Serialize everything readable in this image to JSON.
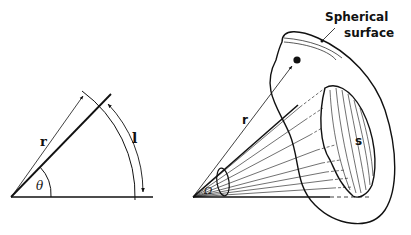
{
  "figure": {
    "left_diagram": {
      "title": "Plane angle",
      "labels": {
        "radius": "r",
        "angle": "θ",
        "arc_length": "l"
      }
    },
    "right_diagram": {
      "title": "Solid angle",
      "labels": {
        "radius": "r",
        "solid_angle": "Ω",
        "surface_area": "s",
        "surface_line1": "Spherical",
        "surface_line2": "surface"
      }
    },
    "colors": {
      "ink": "#111111",
      "background": "#ffffff"
    }
  }
}
